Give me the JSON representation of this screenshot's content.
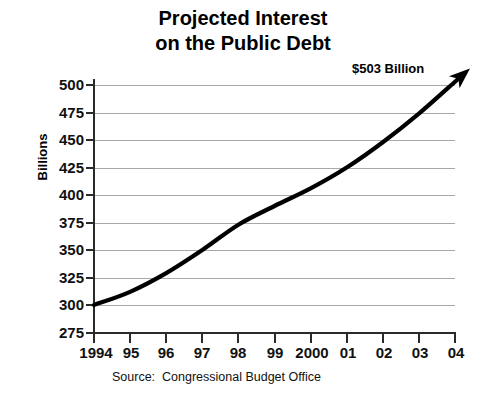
{
  "title": {
    "line1": "Projected Interest",
    "line2": "on the Public Debt"
  },
  "axes": {
    "y_title": "Billions",
    "y_ticks": [
      "500",
      "475",
      "450",
      "425",
      "400",
      "375",
      "350",
      "325",
      "300",
      "275"
    ],
    "x_ticks": [
      "1994",
      "95",
      "96",
      "97",
      "98",
      "99",
      "2000",
      "01",
      "02",
      "03",
      "04"
    ]
  },
  "annotation": {
    "end_label": "$503 Billion"
  },
  "source": {
    "text": "Source:  Congressional Budget Office"
  },
  "colors": {
    "series": "#000000",
    "grid": "#a8a8a8",
    "axis": "#2a2a2a",
    "background": "#ffffff"
  },
  "chart_data": {
    "type": "line",
    "title": "Projected Interest on the Public Debt",
    "subtitle": "",
    "xlabel": "",
    "ylabel": "Billions",
    "categories": [
      "1994",
      "95",
      "96",
      "97",
      "98",
      "99",
      "2000",
      "01",
      "02",
      "03",
      "04"
    ],
    "values": [
      300,
      312,
      329,
      350,
      373,
      390,
      406,
      425,
      448,
      474,
      503
    ],
    "ylim": [
      275,
      500
    ],
    "yticks": [
      275,
      300,
      325,
      350,
      375,
      400,
      425,
      450,
      475,
      500
    ],
    "grid": true,
    "legend": "none",
    "annotations": [
      {
        "text": "$503 Billion",
        "x": "04",
        "y": 503,
        "marker": "arrowhead"
      }
    ],
    "source": "Source:  Congressional Budget Office"
  }
}
